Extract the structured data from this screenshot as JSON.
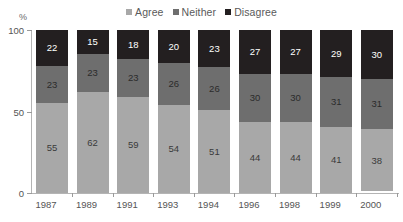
{
  "chart_data": {
    "type": "bar",
    "stacked": true,
    "title": "",
    "xlabel": "",
    "ylabel": "%",
    "ylim": [
      0,
      100
    ],
    "yticks": [
      0,
      50,
      100
    ],
    "grid": false,
    "legend_position": "top-center",
    "categories": [
      "1987",
      "1989",
      "1991",
      "1993",
      "1994",
      "1996",
      "1998",
      "1999",
      "2000"
    ],
    "series": [
      {
        "name": "Agree",
        "color": "#a8a8a8",
        "values": [
          55,
          62,
          59,
          54,
          51,
          44,
          44,
          41,
          38
        ]
      },
      {
        "name": "Neither",
        "color": "#6e6e6e",
        "values": [
          23,
          23,
          23,
          26,
          26,
          30,
          30,
          31,
          31
        ]
      },
      {
        "name": "Disagree",
        "color": "#231f20",
        "values": [
          22,
          15,
          18,
          20,
          23,
          27,
          27,
          29,
          30
        ]
      }
    ],
    "stack_order_top_to_bottom": [
      "Disagree",
      "Neither",
      "Agree"
    ]
  },
  "legend": {
    "items": [
      {
        "label": "Agree",
        "color": "#a8a8a8"
      },
      {
        "label": "Neither",
        "color": "#6e6e6e"
      },
      {
        "label": "Disagree",
        "color": "#231f20"
      }
    ]
  },
  "axis": {
    "y_unit_label": "%",
    "y_tick_labels": [
      "100",
      "50",
      "0"
    ],
    "x_tick_labels": [
      "1987",
      "1989",
      "1991",
      "1993",
      "1994",
      "1996",
      "1998",
      "1999",
      "2000"
    ]
  },
  "bar_labels": {
    "disagree": [
      "22",
      "15",
      "18",
      "20",
      "23",
      "27",
      "27",
      "29",
      "30"
    ],
    "neither": [
      "23",
      "23",
      "23",
      "26",
      "26",
      "30",
      "30",
      "31",
      "31"
    ],
    "agree": [
      "55",
      "62",
      "59",
      "54",
      "51",
      "44",
      "44",
      "41",
      "38"
    ]
  }
}
